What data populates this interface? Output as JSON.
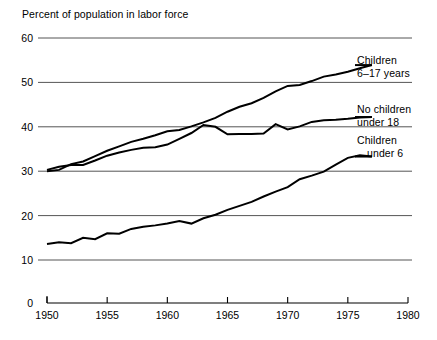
{
  "chart_data": {
    "type": "line",
    "title": "Percent of population in labor force",
    "xlabel": "",
    "ylabel": "Percent of population in labor force",
    "xlim": [
      1950,
      1980
    ],
    "ylim": [
      10,
      60
    ],
    "y_axis_break": true,
    "y_zero_label": "0",
    "grid": true,
    "legend_position": "right-inline",
    "yticks": [
      60,
      50,
      40,
      30,
      20,
      10
    ],
    "ytick_labels": [
      "60",
      "50",
      "40",
      "30",
      "20",
      "10"
    ],
    "xticks": [
      1950,
      1955,
      1960,
      1965,
      1970,
      1975,
      1980
    ],
    "xtick_labels": [
      "1950",
      "1955",
      "1960",
      "1965",
      "1970",
      "1975",
      "1980"
    ],
    "series": [
      {
        "name": "Children 6-17 years",
        "label_line1": "Children",
        "label_line2": "6–17 years",
        "color": "#000000",
        "x": [
          1950,
          1951,
          1952,
          1953,
          1954,
          1955,
          1956,
          1957,
          1958,
          1959,
          1960,
          1961,
          1962,
          1963,
          1964,
          1965,
          1966,
          1967,
          1968,
          1969,
          1970,
          1971,
          1972,
          1973,
          1974,
          1975,
          1976,
          1977
        ],
        "values": [
          30.0,
          30.3,
          31.6,
          32.2,
          33.4,
          34.6,
          35.6,
          36.6,
          37.3,
          38.1,
          39.0,
          39.3,
          40.1,
          41.0,
          42.0,
          43.4,
          44.5,
          45.3,
          46.5,
          48.0,
          49.2,
          49.4,
          50.3,
          51.3,
          51.8,
          52.4,
          53.2,
          53.9
        ]
      },
      {
        "name": "No children under 18",
        "label_line1": "No children",
        "label_line2": "under 18",
        "color": "#000000",
        "x": [
          1950,
          1951,
          1952,
          1953,
          1954,
          1955,
          1956,
          1957,
          1958,
          1959,
          1960,
          1961,
          1962,
          1963,
          1964,
          1965,
          1966,
          1967,
          1968,
          1969,
          1970,
          1971,
          1972,
          1973,
          1974,
          1975,
          1976,
          1977
        ],
        "values": [
          30.3,
          31.0,
          31.4,
          31.4,
          32.4,
          33.5,
          34.2,
          34.8,
          35.3,
          35.4,
          36.0,
          37.3,
          38.6,
          40.4,
          40.0,
          38.3,
          38.4,
          38.4,
          38.5,
          40.6,
          39.4,
          40.1,
          41.1,
          41.5,
          41.6,
          41.8,
          42.1,
          42.2
        ]
      },
      {
        "name": "Children under 6",
        "label_line1": "Children",
        "label_line2": "under 6",
        "color": "#000000",
        "x": [
          1950,
          1951,
          1952,
          1953,
          1954,
          1955,
          1956,
          1957,
          1958,
          1959,
          1960,
          1961,
          1962,
          1963,
          1964,
          1965,
          1966,
          1967,
          1968,
          1969,
          1970,
          1971,
          1972,
          1973,
          1974,
          1975,
          1976,
          1977
        ],
        "values": [
          13.6,
          14.0,
          13.8,
          15.0,
          14.7,
          16.0,
          15.9,
          17.0,
          17.5,
          17.8,
          18.2,
          18.8,
          18.2,
          19.4,
          20.2,
          21.3,
          22.2,
          23.1,
          24.3,
          25.4,
          26.4,
          28.2,
          29.0,
          29.9,
          31.5,
          33.0,
          33.6,
          33.3
        ]
      }
    ]
  },
  "axis": {
    "header_label": "Percent of population in labor force"
  }
}
